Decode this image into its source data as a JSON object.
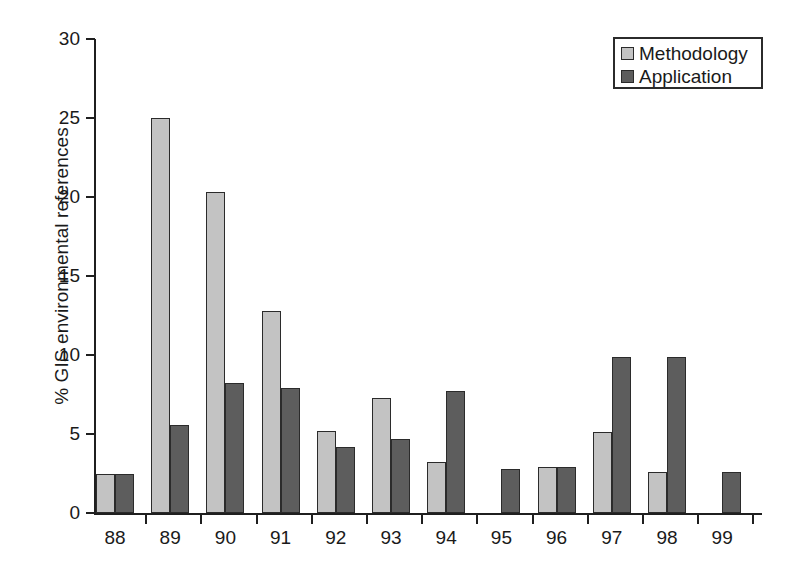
{
  "chart_data": {
    "type": "bar",
    "title": "",
    "subtitle": "",
    "xlabel": "",
    "ylabel": "% GIS environmental references",
    "categories": [
      "88",
      "89",
      "90",
      "91",
      "92",
      "93",
      "94",
      "95",
      "96",
      "97",
      "98",
      "99"
    ],
    "series": [
      {
        "name": "Methodology",
        "color": "#c3c3c3",
        "values": [
          2.5,
          25.0,
          20.3,
          12.8,
          5.2,
          7.3,
          3.2,
          null,
          2.9,
          5.1,
          2.6,
          null
        ]
      },
      {
        "name": "Application",
        "color": "#5d5d5d",
        "values": [
          2.45,
          5.6,
          8.2,
          7.9,
          4.2,
          4.7,
          7.7,
          2.8,
          2.9,
          9.9,
          9.9,
          2.6
        ]
      }
    ],
    "ylim": [
      0,
      30
    ],
    "yticks": [
      0,
      5,
      10,
      15,
      20,
      25,
      30
    ],
    "ytick_labels": [
      "0",
      "5",
      "10",
      "15",
      "20",
      "25",
      "30"
    ],
    "grid": false,
    "legend_position": "top-right",
    "legend_entries": [
      "Methodology",
      "Application"
    ]
  },
  "legend": {
    "items": [
      {
        "label": "Methodology",
        "swatch": "methodology-swatch-icon"
      },
      {
        "label": "Application",
        "swatch": "application-swatch-icon"
      }
    ]
  },
  "axes": {
    "y_title": "% GIS environmental references"
  }
}
